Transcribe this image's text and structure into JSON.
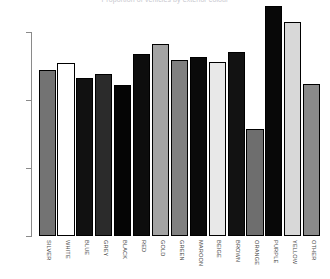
{
  "chart_data": {
    "type": "bar",
    "title": "Proportion of vehicles by exterior colour",
    "xlabel": "",
    "ylabel": "",
    "ylim": [
      0.0,
      0.175
    ],
    "ytick_labels": [
      "0.00",
      "0.05",
      "0.10",
      "0.15"
    ],
    "ytick_values": [
      0.0,
      0.05,
      0.1,
      0.15
    ],
    "grid": false,
    "legend": "none",
    "categories": [
      "SILVER",
      "WHITE",
      "BLUE",
      "GREY",
      "BLACK",
      "RED",
      "GOLD",
      "GREEN",
      "MAROON",
      "BEIGE",
      "BROWN",
      "ORANGE",
      "PURPLE",
      "YELLOW",
      "OTHER"
    ],
    "values": [
      0.122,
      0.1275,
      0.1165,
      0.119,
      0.111,
      0.134,
      0.141,
      0.1295,
      0.1315,
      0.128,
      0.1355,
      0.079,
      0.169,
      0.157,
      0.1115
    ],
    "bar_colors": [
      "#737373",
      "#ffffff",
      "#111111",
      "#2b2b2b",
      "#050505",
      "#0d0d0d",
      "#a3a3a3",
      "#808080",
      "#0a0a0a",
      "#e8e8e8",
      "#121212",
      "#6e6e6e",
      "#080808",
      "#d8d8d8",
      "#8a8a8a"
    ],
    "bar_border_color": "#000000",
    "axis_color": "#8a8a8a",
    "label_color": "#4a4a4a",
    "background": "#ffffff"
  },
  "axis": {
    "y_ticks": [
      {
        "label": "0.15",
        "value": 0.15
      },
      {
        "label": "0.10",
        "value": 0.1
      },
      {
        "label": "0.05",
        "value": 0.05
      },
      {
        "label": "0.00",
        "value": 0.0
      }
    ]
  }
}
